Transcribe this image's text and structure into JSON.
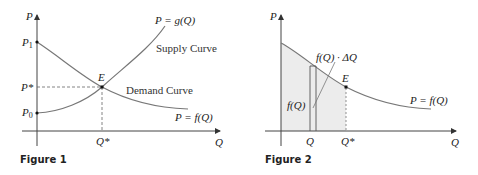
{
  "figures": [
    {
      "caption": "Figure 1",
      "axes": {
        "y_label": "P",
        "x_label": "Q"
      },
      "y_ticks": {
        "p1": "P",
        "p1_sub": "1",
        "pstar": "P*",
        "p0": "P",
        "p0_sub": "0"
      },
      "x_ticks": {
        "qstar": "Q*"
      },
      "point_label": "E",
      "curves": {
        "supply_eq": "P = g(Q)",
        "supply_name": "Supply Curve",
        "demand_name": "Demand Curve",
        "demand_eq": "P = f(Q)"
      }
    },
    {
      "caption": "Figure 2",
      "axes": {
        "y_label": "P",
        "x_label": "Q"
      },
      "x_ticks": {
        "q": "Q",
        "qstar": "Q*"
      },
      "point_label": "E",
      "labels": {
        "strip_area": "f(Q) · ΔQ",
        "height": "f(Q)",
        "demand_eq": "P = f(Q)"
      }
    }
  ],
  "colors": {
    "axis": "#444444",
    "curve": "#666666",
    "shade": "#ececec",
    "text": "#222222"
  }
}
